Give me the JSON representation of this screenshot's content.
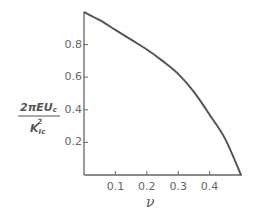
{
  "chart_data": {
    "type": "line",
    "title": "",
    "xlabel": "ν",
    "ylabel": "2πEU_c / K_Ic²",
    "ylabel_numerator": "2πEU",
    "ylabel_numerator_sub": "c",
    "ylabel_denominator": "K",
    "ylabel_denominator_sub": "Ic",
    "ylabel_denominator_sup": "2",
    "xlim": [
      0,
      0.5
    ],
    "ylim": [
      0,
      1.0
    ],
    "x_ticks": [
      "0.1",
      "0.2",
      "0.3",
      "0.4"
    ],
    "y_ticks": [
      "0.2",
      "0.4",
      "0.6",
      "0.8"
    ],
    "grid": false,
    "legend": null,
    "series": [
      {
        "name": "curve",
        "x": [
          0.0,
          0.05,
          0.1,
          0.15,
          0.2,
          0.25,
          0.3,
          0.35,
          0.4,
          0.45,
          0.5
        ],
        "y": [
          1.0,
          0.95,
          0.89,
          0.83,
          0.77,
          0.7,
          0.62,
          0.51,
          0.37,
          0.22,
          0.0
        ]
      }
    ],
    "colors": {
      "line": "#555555",
      "axis": "#666666",
      "text": "#666666"
    }
  }
}
